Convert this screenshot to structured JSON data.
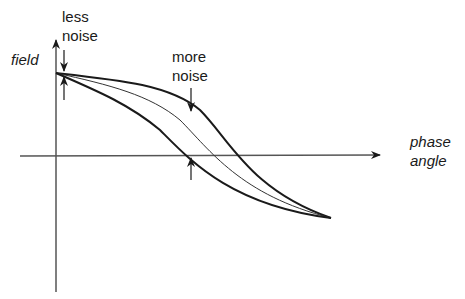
{
  "diagram": {
    "axes": {
      "y_label": "field",
      "x_label_line1": "phase",
      "x_label_line2": "angle"
    },
    "annotations": {
      "less_noise_line1": "less",
      "less_noise_line2": "noise",
      "more_noise_line1": "more",
      "more_noise_line2": "noise"
    },
    "curves": [
      {
        "name": "upper-bound",
        "style": "thick"
      },
      {
        "name": "nominal",
        "style": "thin"
      },
      {
        "name": "lower-bound",
        "style": "thick"
      }
    ],
    "colors": {
      "ink": "#1a1a1a",
      "axis": "#555555",
      "background": "#ffffff"
    }
  }
}
